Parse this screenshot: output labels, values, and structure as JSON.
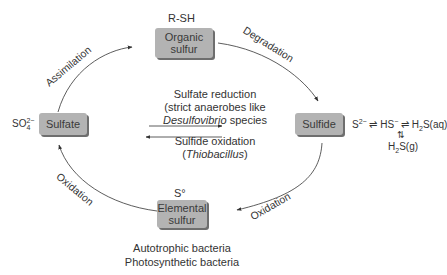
{
  "nodes": {
    "organic": {
      "formula": "R-SH",
      "line1": "Organic",
      "line2": "sulfur"
    },
    "sulfate": {
      "formula": "SO",
      "formula_sub": "4",
      "formula_sup": "2−",
      "label": "Sulfate"
    },
    "sulfide": {
      "label": "Sulfide"
    },
    "elemental": {
      "formula": "S°",
      "line1": "Elemental",
      "line2": "sulfur"
    }
  },
  "edges": {
    "assimilation": "Assimilation",
    "degradation": "Degradation",
    "oxidation_sulfide": "Oxidation",
    "oxidation_elemental": "Oxidation"
  },
  "center": {
    "reduction_title": "Sulfate reduction",
    "reduction_l2": "(strict anaerobes like",
    "reduction_genus": "Desulfovibrio",
    "reduction_species": " species",
    "oxidation_title": "Sulfide oxidation",
    "oxidation_genus": "Thiobacillus"
  },
  "equilibrium": {
    "s2": "S",
    "s2_sup": "2−",
    "arrow": " ⇌ ",
    "hs": "HS",
    "hs_sup": "−",
    "h2s_aq": "S(aq)",
    "h": "H",
    "sub2": "2",
    "updown": "⇅",
    "h2s_g": "S(g)"
  },
  "bottom": {
    "line1": "Autotrophic bacteria",
    "line2": "Photosynthetic bacteria"
  }
}
